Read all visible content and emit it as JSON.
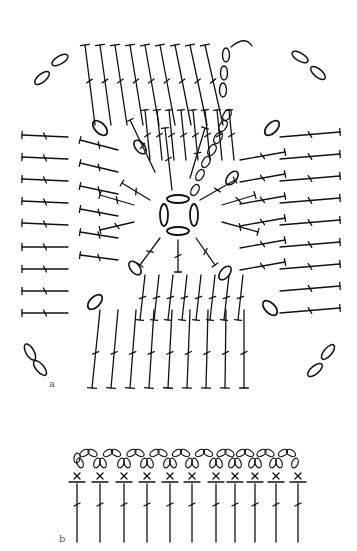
{
  "figure": {
    "labels": {
      "a": "a",
      "b": "b"
    },
    "stroke_color": "#111111",
    "background": "#ffffff"
  },
  "diagram_a": {
    "description": "Granny-square crochet chart: center ring of 4 chains, radiating treble stitches, corner chain spaces",
    "center": [
      178,
      215
    ],
    "center_ring_chains": 4,
    "corner_chain_spaces": 4,
    "rounds": 3
  },
  "diagram_b": {
    "description": "Edging chart: row of treble stitches topped with single crochet (x) and picot chain loops",
    "stitch_count": 11,
    "symbols": [
      "treble",
      "single-crochet-x",
      "chain-loop"
    ]
  }
}
